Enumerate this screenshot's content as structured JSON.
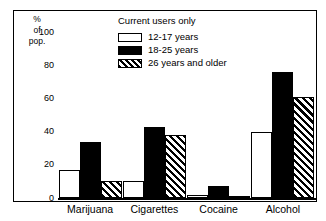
{
  "chart_data": {
    "type": "bar",
    "title": "",
    "annotation": "Current users only",
    "xlabel": "",
    "ylabel": "% of pop.",
    "ylabel_lines": [
      "%",
      "of",
      "pop."
    ],
    "categories": [
      "Marijuana",
      "Cigarettes",
      "Cocaine",
      "Alcohol"
    ],
    "series": [
      {
        "name": "12-17 years",
        "values": [
          17,
          10,
          2,
          40
        ],
        "fill": "white"
      },
      {
        "name": "18-25 years",
        "values": [
          34,
          43,
          7,
          76
        ],
        "fill": "black"
      },
      {
        "name": "26 years and older",
        "values": [
          10,
          38,
          1,
          61
        ],
        "fill": "hatched"
      }
    ],
    "ylim": [
      0,
      110
    ],
    "yticks": [
      0,
      20,
      40,
      60,
      80,
      100
    ],
    "ytick_labels": [
      "0",
      "20",
      "40",
      "60",
      "80",
      "100"
    ],
    "grid": false,
    "legend_position": "top-center",
    "legend_entries": [
      "12-17 years",
      "18-25 years",
      "26 years and older"
    ],
    "colors": {
      "series_1": "#ffffff",
      "series_2": "#000000",
      "series_3": "#000000",
      "axis": "#000000",
      "background": "#ffffff"
    }
  }
}
